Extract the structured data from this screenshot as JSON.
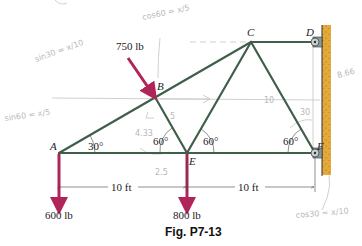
{
  "figure": {
    "caption": "Fig. P7-13",
    "colors": {
      "member": "#3f5f4a",
      "load_arrow": "#b0245a",
      "wall": "#e3a93a",
      "pencil": "#c4c4c4"
    },
    "nodes": [
      {
        "id": "A",
        "label": "A"
      },
      {
        "id": "B",
        "label": "B"
      },
      {
        "id": "C",
        "label": "C"
      },
      {
        "id": "D",
        "label": "D"
      },
      {
        "id": "E",
        "label": "E"
      },
      {
        "id": "F",
        "label": "F"
      }
    ],
    "members": [
      "AB",
      "BC",
      "CD",
      "AE",
      "EF",
      "BE",
      "CE",
      "CF"
    ],
    "supports": [
      {
        "node": "D",
        "type": "pin-to-wall"
      },
      {
        "node": "F",
        "type": "pin-to-wall"
      }
    ],
    "loads": [
      {
        "node": "B",
        "label": "750 lb",
        "direction": "diagonal-down-right"
      },
      {
        "node": "A",
        "label": "600 lb",
        "direction": "down"
      },
      {
        "node": "E",
        "label": "800 lb",
        "direction": "down"
      }
    ],
    "angles": [
      {
        "at": "A",
        "label": "30°"
      },
      {
        "at": "E-left",
        "label": "60°"
      },
      {
        "at": "E-right",
        "label": "60°"
      },
      {
        "at": "F",
        "label": "60°"
      }
    ],
    "dimensions": [
      {
        "span": "A-E",
        "label": "10 ft"
      },
      {
        "span": "E-F",
        "label": "10 ft"
      }
    ],
    "handwritten_notes": [
      {
        "text": "cos60 = x/5",
        "position": "top-center"
      },
      {
        "text": "sin30 = x/10",
        "position": "upper-left"
      },
      {
        "text": "sin60 = x/5",
        "position": "left"
      },
      {
        "text": "5",
        "position": "on member BE"
      },
      {
        "text": "4.33",
        "position": "below B"
      },
      {
        "text": "2.5",
        "position": "below AE near E"
      },
      {
        "text": "10",
        "position": "center-right"
      },
      {
        "text": "30",
        "position": "near F angle"
      },
      {
        "text": "8.66",
        "position": "right of wall"
      },
      {
        "text": "cos30 = x/10",
        "position": "bottom-right"
      }
    ]
  }
}
